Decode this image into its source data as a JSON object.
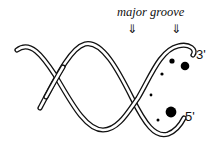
{
  "figure": {
    "labels": {
      "groove_text": "major groove",
      "arrow_left": "⇓",
      "arrow_right": "⇓",
      "end_top": "3'",
      "end_bottom": "5'"
    },
    "colors": {
      "stroke": "#111111",
      "background": "#ffffff",
      "dots": "#000000"
    },
    "dots": [
      {
        "cx": 172,
        "cy": 61,
        "r": 2.6
      },
      {
        "cx": 185,
        "cy": 66,
        "r": 4.3
      },
      {
        "cx": 162,
        "cy": 74,
        "r": 1.6
      },
      {
        "cx": 151,
        "cy": 95,
        "r": 1.4
      },
      {
        "cx": 171,
        "cy": 112,
        "r": 5.4
      },
      {
        "cx": 158,
        "cy": 120,
        "r": 1.5
      }
    ]
  }
}
